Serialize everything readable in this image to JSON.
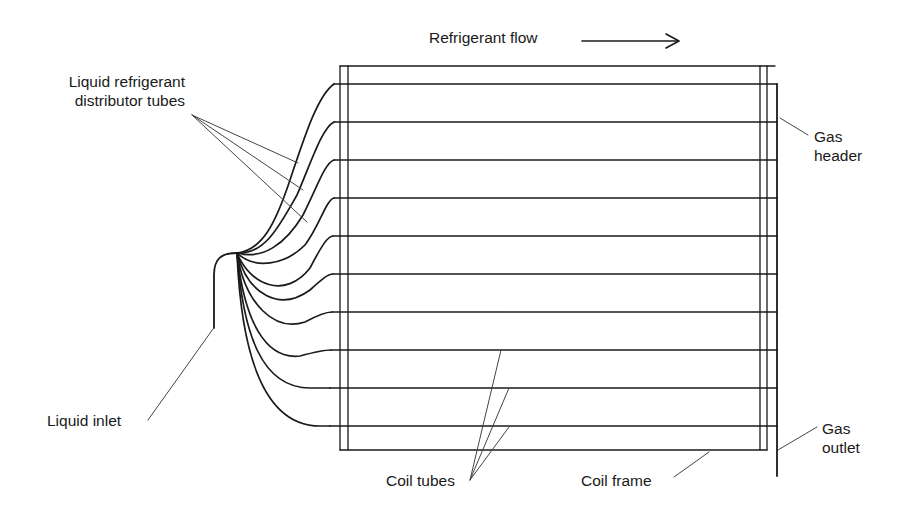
{
  "diagram": {
    "labels": {
      "refrigerant_flow": "Refrigerant flow",
      "distributor_line1": "Liquid refrigerant",
      "distributor_line2": "distributor tubes",
      "gas_header_line1": "Gas",
      "gas_header_line2": "header",
      "liquid_inlet": "Liquid inlet",
      "coil_tubes": "Coil tubes",
      "coil_frame": "Coil frame",
      "gas_outlet_line1": "Gas",
      "gas_outlet_line2": "outlet"
    },
    "coil_tube_count": 10,
    "flow_direction": "left-to-right",
    "colors": {
      "line": "#1a1a1a",
      "leader": "#444444",
      "background": "#ffffff"
    }
  }
}
